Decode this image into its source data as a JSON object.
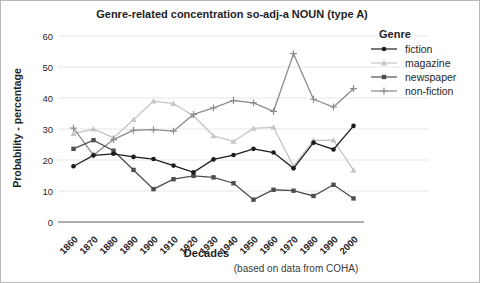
{
  "title": "Genre-related concentration so-adj-a NOUN (type A)",
  "caption": "(based on data from COHA)",
  "axes": {
    "x_label": "Decades",
    "y_label": "Probability - percentage",
    "y_ticks": [
      0,
      10,
      20,
      30,
      40,
      50,
      60
    ]
  },
  "legend": {
    "title": "Genre"
  },
  "colors": {
    "grid": "#e7e7e7",
    "axis": "#5a5a5a",
    "text": "#1f1f1f",
    "fiction": "#1c1c1c",
    "magazine": "#c6c6c6",
    "newspaper": "#4e4e4e",
    "non_fiction": "#8c8c8c"
  },
  "chart_data": {
    "type": "line",
    "title": "Genre-related concentration so-adj-a NOUN (type A)",
    "xlabel": "Decades",
    "ylabel": "Probability - percentage",
    "ylim": [
      0,
      60
    ],
    "grid": "horizontal",
    "x_tick_rotation": 45,
    "legend_position": "right",
    "legend_title": "Genre",
    "annotation": "(based on data from COHA)",
    "categories": [
      "1860",
      "1870",
      "1880",
      "1890",
      "1900",
      "1910",
      "1920",
      "1930",
      "1940",
      "1950",
      "1960",
      "1970",
      "1980",
      "1990",
      "2000"
    ],
    "series": [
      {
        "name": "fiction",
        "marker": "circle",
        "color": "#1c1c1c",
        "values": [
          18,
          21.5,
          22,
          21,
          20.3,
          18.2,
          16,
          20.2,
          21.6,
          23.6,
          22.4,
          17.3,
          25.6,
          23.4,
          31
        ]
      },
      {
        "name": "magazine",
        "marker": "triangle",
        "color": "#c6c6c6",
        "values": [
          28.5,
          30,
          27.2,
          33,
          39,
          38.2,
          34.3,
          27.8,
          26,
          30.2,
          30.6,
          18,
          26.3,
          26.4,
          16.7
        ]
      },
      {
        "name": "newspaper",
        "marker": "square",
        "color": "#4e4e4e",
        "values": [
          23.6,
          26.4,
          23,
          16.8,
          10.6,
          13.8,
          14.9,
          14.4,
          12.5,
          7.2,
          10.4,
          10.1,
          8.4,
          12,
          7.6
        ]
      },
      {
        "name": "non-fiction",
        "marker": "plus",
        "color": "#8c8c8c",
        "values": [
          30.3,
          21.6,
          26.6,
          29.6,
          29.8,
          29.3,
          34.7,
          36.8,
          39.2,
          38.4,
          35.7,
          54.3,
          39.6,
          37.1,
          43
        ]
      }
    ]
  }
}
